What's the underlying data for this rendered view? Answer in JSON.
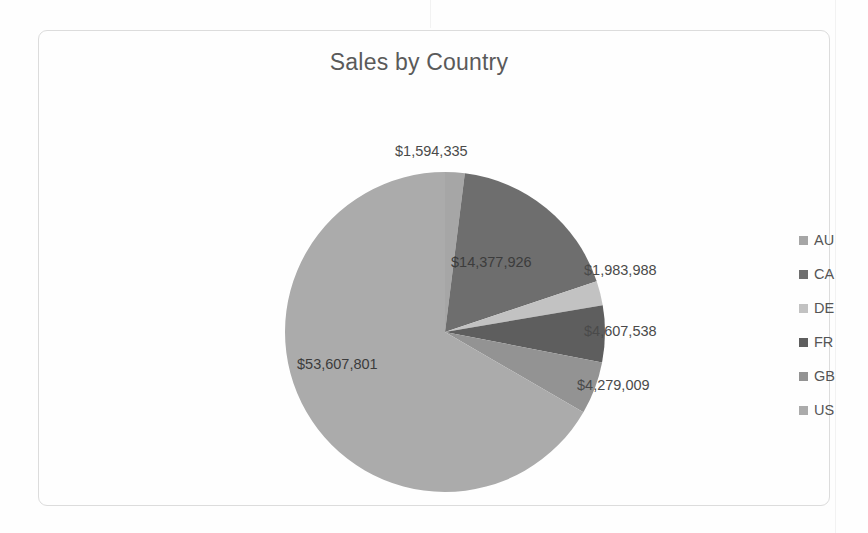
{
  "chart_data": {
    "type": "pie",
    "title": "Sales by Country",
    "categories": [
      "AU",
      "CA",
      "DE",
      "FR",
      "GB",
      "US"
    ],
    "values": [
      1594335,
      14377926,
      1983988,
      4607538,
      4279009,
      53607801
    ],
    "labels": [
      "$1,594,335",
      "$14,377,926",
      "$1,983,988",
      "$4,607,538",
      "$4,279,009",
      "$53,607,801"
    ],
    "colors": [
      "#a6a6a6",
      "#6e6e6e",
      "#c2c2c2",
      "#5e5e5e",
      "#939393",
      "#ababab"
    ],
    "legend_position": "right",
    "grid": false,
    "xlabel": "",
    "ylabel": "",
    "total": 80450597,
    "start_angle_deg": 0,
    "direction": "clockwise"
  },
  "chart": {
    "title": "Sales by Country"
  },
  "legend": {
    "items": [
      {
        "label": "AU",
        "color": "#a6a6a6"
      },
      {
        "label": "CA",
        "color": "#6e6e6e"
      },
      {
        "label": "DE",
        "color": "#c2c2c2"
      },
      {
        "label": "FR",
        "color": "#5e5e5e"
      },
      {
        "label": "GB",
        "color": "#939393"
      },
      {
        "label": "US",
        "color": "#ababab"
      }
    ]
  },
  "data_labels": {
    "au": "$1,594,335",
    "ca": "$14,377,926",
    "de": "$1,983,988",
    "fr": "$4,607,538",
    "gb": "$4,279,009",
    "us": "$53,607,801"
  }
}
